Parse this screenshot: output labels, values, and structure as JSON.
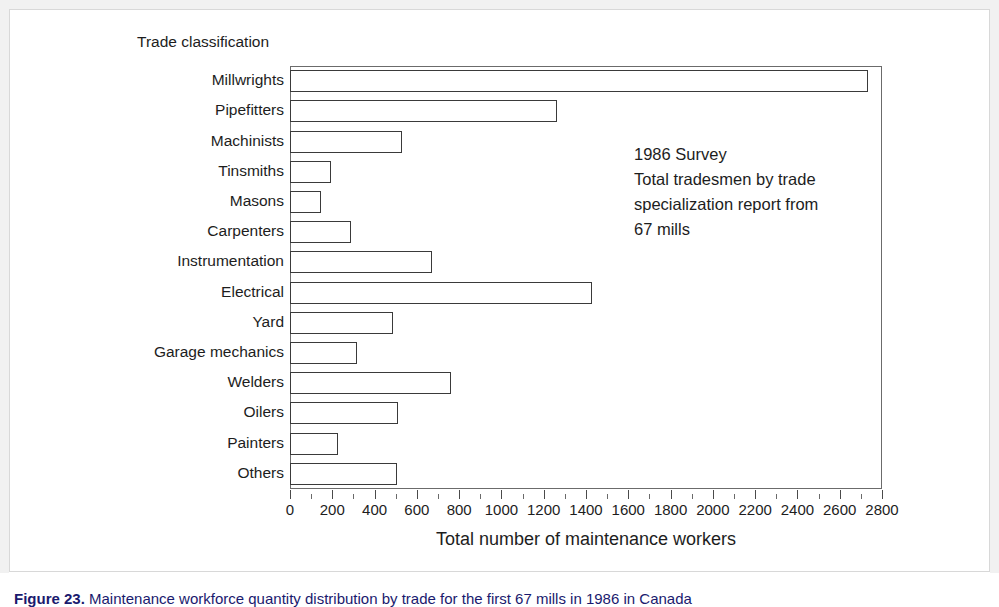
{
  "chart_data": {
    "type": "bar",
    "orientation": "horizontal",
    "title": "",
    "xlabel": "Total number of maintenance workers",
    "ylabel": "Trade classification",
    "xlim": [
      0,
      2800
    ],
    "xtick_step": 200,
    "xminor_step": 100,
    "grid": false,
    "legend": null,
    "categories": [
      "Millwrights",
      "Pipefitters",
      "Machinists",
      "Tinsmiths",
      "Masons",
      "Carpenters",
      "Instrumentation",
      "Electrical",
      "Yard",
      "Garage mechanics",
      "Welders",
      "Oilers",
      "Painters",
      "Others"
    ],
    "values": [
      2735,
      1265,
      530,
      195,
      145,
      290,
      670,
      1430,
      485,
      315,
      760,
      510,
      225,
      505
    ],
    "xticks": [
      0,
      200,
      400,
      600,
      800,
      1000,
      1200,
      1400,
      1600,
      1800,
      2000,
      2200,
      2400,
      2600,
      2800
    ],
    "annotation": "1986 Survey\nTotal tradesmen by trade\nspecialization report from\n67 mills",
    "bar_fill": "#ffffff",
    "bar_edge": "#3a3a3a",
    "axis_color": "#6b6b6b",
    "text_color": "#1d1d1d"
  },
  "caption": {
    "figure_label": "Figure 23.",
    "text": "Maintenance workforce quantity distribution by trade for the first 67 mills in 1986 in Canada",
    "color": "#1a1a6e"
  }
}
